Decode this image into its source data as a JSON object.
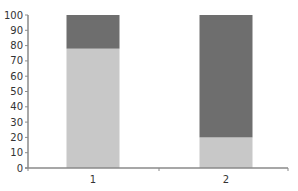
{
  "chart_data": {
    "type": "bar",
    "stacked": true,
    "title": "",
    "xlabel": "",
    "ylabel": "",
    "categories": [
      "1",
      "2"
    ],
    "series": [
      {
        "name": "lower",
        "color": "#c8c8c8",
        "values": [
          78,
          20
        ]
      },
      {
        "name": "upper",
        "color": "#6e6e6e",
        "values": [
          22,
          80
        ]
      }
    ],
    "ylim": [
      0,
      100
    ],
    "yticks": [
      0,
      10,
      20,
      30,
      40,
      50,
      60,
      70,
      80,
      90,
      100
    ],
    "grid": false,
    "legend": "none"
  },
  "colors": {
    "axis": "#8a8a8a",
    "text": "#333333"
  }
}
